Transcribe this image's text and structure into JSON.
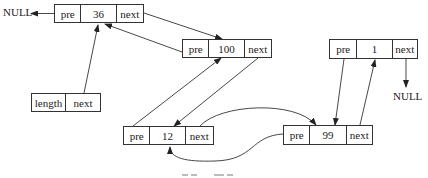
{
  "diagram": {
    "type": "doubly-linked-list",
    "null_left": "NULL",
    "null_right": "NULL",
    "caption_partial": "",
    "head": {
      "cells": [
        "length",
        "next"
      ]
    },
    "nodes": [
      {
        "id": "n36",
        "cells": [
          "pre",
          "36",
          "next"
        ]
      },
      {
        "id": "n100",
        "cells": [
          "pre",
          "100",
          "next"
        ]
      },
      {
        "id": "n12",
        "cells": [
          "pre",
          "12",
          "next"
        ]
      },
      {
        "id": "n99",
        "cells": [
          "pre",
          "99",
          "next"
        ]
      },
      {
        "id": "n1",
        "cells": [
          "pre",
          "1",
          "next"
        ]
      }
    ],
    "edges": [
      {
        "from": "head.next",
        "to": "n36"
      },
      {
        "from": "n36.pre",
        "to": "NULL"
      },
      {
        "from": "n36.next",
        "to": "n100"
      },
      {
        "from": "n100.pre",
        "to": "n36"
      },
      {
        "from": "n100.next",
        "to": "n12"
      },
      {
        "from": "n12.pre",
        "to": "n100"
      },
      {
        "from": "n12.next",
        "to": "n99"
      },
      {
        "from": "n99.pre",
        "to": "n12"
      },
      {
        "from": "n99.next",
        "to": "n1"
      },
      {
        "from": "n1.pre",
        "to": "n99"
      },
      {
        "from": "n1.next",
        "to": "NULL"
      }
    ]
  }
}
